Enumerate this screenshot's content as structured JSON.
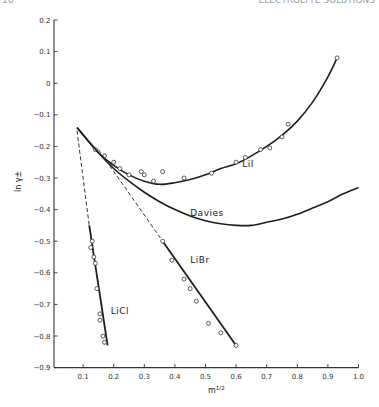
{
  "page": {
    "number_fragment": "16",
    "running_head_fragment": "ELECTROLYTE SOLUTIONS"
  },
  "chart_data": {
    "type": "line",
    "title": "",
    "xlabel": "m^1/2",
    "ylabel": "ln γ±",
    "xlim": [
      0,
      1.0
    ],
    "ylim": [
      -0.9,
      0.2
    ],
    "x_ticks": [
      "0.1",
      "0.2",
      "0.3",
      "0.4",
      "0.5",
      "0.6",
      "0.7",
      "0.8",
      "0.9",
      "1.0"
    ],
    "y_ticks": [
      "0.2",
      "0.1",
      "0",
      "-0.1",
      "-0.2",
      "-0.3",
      "-0.4",
      "-0.5",
      "-0.6",
      "-0.7",
      "-0.8",
      "-0.9"
    ],
    "grid": false,
    "legend": "inline labels",
    "series": [
      {
        "name": "LiI",
        "style": "solid",
        "curve": [
          [
            0.08,
            -0.14
          ],
          [
            0.15,
            -0.22
          ],
          [
            0.2,
            -0.26
          ],
          [
            0.25,
            -0.29
          ],
          [
            0.3,
            -0.31
          ],
          [
            0.35,
            -0.32
          ],
          [
            0.4,
            -0.315
          ],
          [
            0.45,
            -0.305
          ],
          [
            0.5,
            -0.29
          ],
          [
            0.55,
            -0.27
          ],
          [
            0.6,
            -0.255
          ],
          [
            0.65,
            -0.23
          ],
          [
            0.7,
            -0.2
          ],
          [
            0.75,
            -0.165
          ],
          [
            0.8,
            -0.12
          ],
          [
            0.85,
            -0.06
          ],
          [
            0.9,
            0.02
          ],
          [
            0.93,
            0.08
          ]
        ],
        "points": [
          [
            0.14,
            -0.21
          ],
          [
            0.17,
            -0.23
          ],
          [
            0.2,
            -0.25
          ],
          [
            0.22,
            -0.27
          ],
          [
            0.25,
            -0.29
          ],
          [
            0.29,
            -0.28
          ],
          [
            0.3,
            -0.29
          ],
          [
            0.33,
            -0.31
          ],
          [
            0.36,
            -0.28
          ],
          [
            0.43,
            -0.3
          ],
          [
            0.52,
            -0.285
          ],
          [
            0.6,
            -0.25
          ],
          [
            0.63,
            -0.235
          ],
          [
            0.68,
            -0.21
          ],
          [
            0.71,
            -0.205
          ],
          [
            0.75,
            -0.17
          ],
          [
            0.77,
            -0.13
          ],
          [
            0.93,
            0.08
          ]
        ]
      },
      {
        "name": "Davies",
        "style": "solid",
        "curve": [
          [
            0.08,
            -0.14
          ],
          [
            0.15,
            -0.22
          ],
          [
            0.2,
            -0.27
          ],
          [
            0.25,
            -0.31
          ],
          [
            0.3,
            -0.345
          ],
          [
            0.35,
            -0.375
          ],
          [
            0.4,
            -0.4
          ],
          [
            0.45,
            -0.42
          ],
          [
            0.5,
            -0.435
          ],
          [
            0.55,
            -0.445
          ],
          [
            0.6,
            -0.45
          ],
          [
            0.65,
            -0.45
          ],
          [
            0.7,
            -0.44
          ],
          [
            0.75,
            -0.43
          ],
          [
            0.8,
            -0.415
          ],
          [
            0.85,
            -0.395
          ],
          [
            0.9,
            -0.375
          ],
          [
            0.95,
            -0.35
          ],
          [
            1.0,
            -0.33
          ]
        ]
      },
      {
        "name": "LiBr",
        "style": "solid with dashed extrapolation",
        "dashed": [
          [
            0.15,
            -0.21
          ],
          [
            0.36,
            -0.5
          ]
        ],
        "curve": [
          [
            0.36,
            -0.5
          ],
          [
            0.6,
            -0.83
          ]
        ],
        "points": [
          [
            0.36,
            -0.5
          ],
          [
            0.39,
            -0.56
          ],
          [
            0.43,
            -0.62
          ],
          [
            0.45,
            -0.65
          ],
          [
            0.47,
            -0.69
          ],
          [
            0.51,
            -0.76
          ],
          [
            0.55,
            -0.79
          ],
          [
            0.6,
            -0.83
          ]
        ]
      },
      {
        "name": "LiCl",
        "style": "solid with dashed extrapolation",
        "dashed": [
          [
            0.08,
            -0.15
          ],
          [
            0.12,
            -0.45
          ]
        ],
        "curve": [
          [
            0.12,
            -0.45
          ],
          [
            0.18,
            -0.83
          ]
        ],
        "points": [
          [
            0.13,
            -0.5
          ],
          [
            0.125,
            -0.52
          ],
          [
            0.135,
            -0.55
          ],
          [
            0.14,
            -0.57
          ],
          [
            0.145,
            -0.65
          ],
          [
            0.155,
            -0.73
          ],
          [
            0.155,
            -0.75
          ],
          [
            0.165,
            -0.8
          ],
          [
            0.17,
            -0.82
          ]
        ]
      }
    ],
    "annotations": [
      {
        "text": "LiI",
        "x": 0.62,
        "y": -0.265
      },
      {
        "text": "Davies",
        "x": 0.45,
        "y": -0.42
      },
      {
        "text": "LiBr",
        "x": 0.45,
        "y": -0.57
      },
      {
        "text": "LiCl",
        "x": 0.19,
        "y": -0.73
      }
    ]
  }
}
